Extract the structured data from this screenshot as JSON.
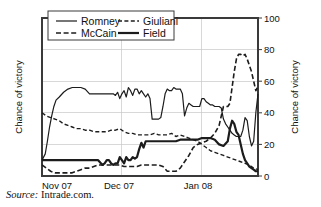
{
  "figure": {
    "source_prefix": "Source:",
    "source_text": " Intrade.com."
  },
  "chart_data": {
    "type": "line",
    "title": "",
    "xlabel": "",
    "ylabel": "Chance of victory",
    "ylabel_right": "Chance of victory",
    "ylim": [
      0,
      100
    ],
    "yticks": [
      0,
      20,
      40,
      60,
      80,
      100
    ],
    "ytick_labels": [
      "0",
      "20",
      "40",
      "60",
      "80",
      "100"
    ],
    "xlim": [
      0,
      100
    ],
    "xticks": [
      0,
      37,
      74
    ],
    "xtick_labels": [
      "Nov 07",
      "Dec 07",
      "Jan 08"
    ],
    "grid": true,
    "legend_position": "top-left-inside",
    "legend_entries": [
      {
        "name": "Romney",
        "style": "solid",
        "width": 1.2
      },
      {
        "name": "Giuliani",
        "style": "dashed",
        "width": 1.4
      },
      {
        "name": "McCain",
        "style": "dashed",
        "width": 1.6
      },
      {
        "name": "Field",
        "style": "solid",
        "width": 2.2
      }
    ],
    "series": [
      {
        "name": "Romney",
        "style": "solid",
        "width": 1.2,
        "x": [
          0,
          1.5,
          2.5,
          3.5,
          4.5,
          5.5,
          6.5,
          8,
          10,
          12,
          14,
          16,
          18,
          20,
          22,
          24,
          26,
          28,
          30,
          32,
          33,
          34,
          35,
          36,
          37,
          38,
          39,
          40,
          41,
          42,
          43,
          44,
          45,
          46,
          47,
          48,
          49,
          50,
          51,
          52,
          53,
          54,
          55,
          56,
          57,
          58,
          59,
          60,
          61,
          62,
          63,
          64,
          65,
          66,
          67,
          68,
          69,
          70,
          71,
          72,
          73,
          74,
          75,
          76,
          77,
          78,
          79,
          80,
          81,
          82,
          83,
          84,
          85,
          86,
          87,
          88,
          89,
          90,
          91,
          92,
          93,
          94,
          95,
          96,
          97,
          98,
          99,
          100
        ],
        "y": [
          10,
          14,
          22,
          31,
          38,
          44,
          48,
          50,
          53,
          55,
          56,
          56,
          56,
          55,
          52,
          52,
          52,
          52,
          52,
          52,
          52,
          51,
          53,
          49,
          52,
          54,
          50,
          56,
          54,
          51,
          55,
          55,
          52,
          54,
          52,
          50,
          52,
          49,
          36,
          36,
          36,
          36,
          37,
          44,
          52,
          55,
          54,
          54,
          56,
          55,
          55,
          55,
          52,
          38,
          43,
          46,
          45,
          44,
          44,
          44,
          44,
          49,
          49,
          47,
          46,
          45,
          45,
          44,
          44,
          44,
          43,
          36,
          33,
          31,
          29,
          27,
          26,
          25,
          25,
          25,
          29,
          37,
          35,
          25,
          19,
          22,
          40,
          52
        ]
      },
      {
        "name": "Giuliani",
        "style": "dashed",
        "width": 1.4,
        "x": [
          0,
          2,
          4,
          6,
          8,
          10,
          12,
          14,
          16,
          18,
          20,
          22,
          24,
          26,
          28,
          30,
          32,
          34,
          36,
          38,
          40,
          42,
          44,
          46,
          48,
          50,
          52,
          54,
          56,
          58,
          60,
          62,
          64,
          66,
          68,
          70,
          72,
          74,
          76,
          78,
          80,
          82,
          84,
          86,
          88,
          90,
          92,
          94,
          96,
          98,
          100
        ],
        "y": [
          40,
          38,
          37,
          36,
          35,
          33,
          32,
          31,
          30,
          30,
          29,
          29,
          28,
          28,
          28,
          28,
          29,
          29,
          30,
          28,
          27,
          27,
          26,
          26,
          26,
          26,
          27,
          26,
          26,
          26,
          27,
          25,
          26,
          25,
          24,
          23,
          22,
          20,
          18,
          16,
          15,
          14,
          13,
          12,
          11,
          10,
          9,
          8,
          7,
          5,
          4
        ]
      },
      {
        "name": "McCain",
        "style": "dashed",
        "width": 1.6,
        "x": [
          0,
          2,
          4,
          6,
          8,
          10,
          12,
          14,
          16,
          18,
          20,
          22,
          24,
          26,
          28,
          30,
          32,
          34,
          36,
          38,
          40,
          42,
          44,
          46,
          48,
          50,
          52,
          54,
          56,
          58,
          60,
          62,
          64,
          66,
          68,
          70,
          72,
          74,
          76,
          78,
          80,
          82,
          83,
          84,
          85,
          86,
          87,
          88,
          89,
          90,
          91,
          92,
          93,
          94,
          95,
          96,
          97,
          98,
          99,
          100
        ],
        "y": [
          7,
          5,
          3,
          2,
          2,
          2,
          2,
          2,
          3,
          4,
          5,
          5,
          6,
          7,
          7,
          7,
          7,
          7,
          7,
          6,
          6,
          6,
          6,
          7,
          7,
          7,
          7,
          7,
          6,
          3,
          3,
          3,
          5,
          9,
          13,
          18,
          20,
          21,
          22,
          24,
          27,
          32,
          38,
          44,
          44,
          44,
          46,
          56,
          66,
          74,
          77,
          77,
          76,
          77,
          74,
          70,
          66,
          60,
          54,
          57
        ]
      },
      {
        "name": "Field",
        "style": "solid",
        "width": 2.2,
        "x": [
          0,
          4,
          8,
          12,
          16,
          20,
          24,
          26,
          28,
          29,
          30,
          31,
          32,
          33,
          34,
          35,
          36,
          37,
          38,
          39,
          40,
          41,
          42,
          43,
          44,
          45,
          46,
          47,
          48,
          50,
          52,
          54,
          56,
          58,
          60,
          62,
          64,
          66,
          68,
          70,
          72,
          74,
          76,
          78,
          80,
          82,
          84,
          86,
          87,
          88,
          89,
          90,
          91,
          92,
          93,
          94,
          95,
          96,
          97,
          98,
          99,
          100
        ],
        "y": [
          10,
          10,
          10,
          10,
          10,
          10,
          10,
          10,
          7,
          8,
          10,
          10,
          8,
          7,
          8,
          8,
          12,
          10,
          8,
          12,
          10,
          10,
          12,
          11,
          12,
          17,
          21,
          18,
          22,
          22,
          22,
          22,
          22,
          22,
          22,
          22,
          23,
          23,
          23,
          23,
          23,
          24,
          24,
          24,
          23,
          20,
          19,
          22,
          30,
          35,
          33,
          28,
          26,
          20,
          14,
          10,
          8,
          6,
          5,
          4,
          3,
          3
        ]
      }
    ]
  }
}
